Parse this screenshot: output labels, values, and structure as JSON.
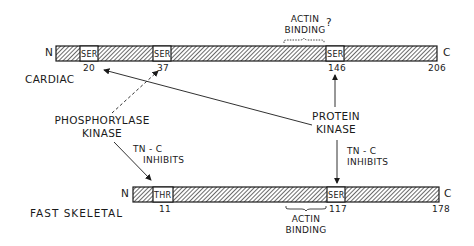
{
  "cardiac": {
    "label": "CARDIAC",
    "n_terminus": "N",
    "c_terminus": "C",
    "sites": [
      {
        "residue": "SER",
        "position": "20"
      },
      {
        "residue": "SER",
        "position": "37"
      },
      {
        "residue": "SER",
        "position": "146"
      }
    ],
    "end_position": "206",
    "actin_binding_label_line1": "ACTIN",
    "actin_binding_label_line2": "BINDING",
    "actin_binding_question": "?"
  },
  "fast_skeletal": {
    "label": "FAST SKELETAL",
    "n_terminus": "N",
    "c_terminus": "C",
    "sites": [
      {
        "residue": "THR",
        "position": "11"
      },
      {
        "residue": "SER",
        "position": "117"
      }
    ],
    "end_position": "178",
    "actin_binding_label_line1": "ACTIN",
    "actin_binding_label_line2": "BINDING"
  },
  "kinases": {
    "phosphorylase_kinase_line1": "PHOSPHORYLASE",
    "phosphorylase_kinase_line2": "KINASE",
    "protein_kinase_line1": "PROTEIN",
    "protein_kinase_line2": "KINASE"
  },
  "annotations": {
    "tnc_inhibits_left_line1": "TN - C",
    "tnc_inhibits_left_line2": "INHIBITS",
    "tnc_inhibits_right_line1": "TN - C",
    "tnc_inhibits_right_line2": "INHIBITS"
  },
  "colors": {
    "ink": "#1a1a1a",
    "background": "#ffffff"
  }
}
